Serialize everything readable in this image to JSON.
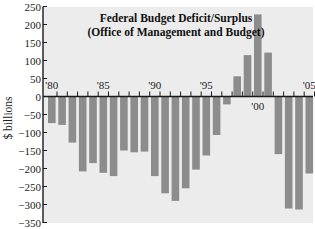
{
  "chart_data": {
    "type": "bar",
    "title": "Federal Budget Deficit/Surplus",
    "subtitle": "(Office of Management and Budget)",
    "xlabel": "",
    "ylabel": "$ billions",
    "ylim": [
      -350,
      250
    ],
    "yticks": [
      250,
      200,
      150,
      100,
      50,
      0,
      -50,
      -100,
      -150,
      -200,
      -250,
      -300,
      -350
    ],
    "ytick_labels": [
      "250",
      "200",
      "150",
      "100",
      "50",
      "0",
      "−50",
      "−100",
      "−150",
      "−200",
      "−250",
      "−300",
      "−350"
    ],
    "categories": [
      "1980",
      "1981",
      "1982",
      "1983",
      "1984",
      "1985",
      "1986",
      "1987",
      "1988",
      "1989",
      "1990",
      "1991",
      "1992",
      "1993",
      "1994",
      "1995",
      "1996",
      "1997",
      "1998",
      "1999",
      "2000",
      "2001",
      "2002",
      "2003",
      "2004",
      "2005"
    ],
    "xtick_labels": [
      {
        "label": "'80",
        "index": 0,
        "position": "above"
      },
      {
        "label": "'85",
        "index": 5,
        "position": "above"
      },
      {
        "label": "'90",
        "index": 10,
        "position": "above"
      },
      {
        "label": "'95",
        "index": 15,
        "position": "above"
      },
      {
        "label": "'00",
        "index": 20,
        "position": "below"
      },
      {
        "label": "'05",
        "index": 25,
        "position": "above"
      }
    ],
    "values": [
      -74,
      -79,
      -128,
      -208,
      -185,
      -212,
      -221,
      -150,
      -155,
      -153,
      -221,
      -269,
      -290,
      -255,
      -203,
      -164,
      -107,
      -22,
      56,
      115,
      228,
      122,
      -160,
      -311,
      -314,
      -214
    ],
    "grid": false,
    "legend": null,
    "colors": {
      "bar": "#8c8c8c",
      "plot_background": "#ececec",
      "axis": "#1a1a1a",
      "text": "#222222"
    }
  }
}
